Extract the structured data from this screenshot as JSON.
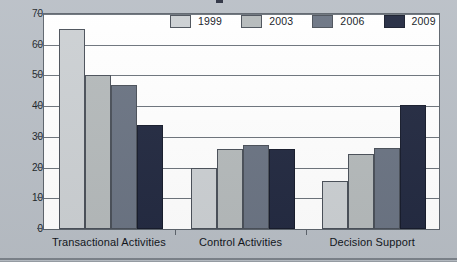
{
  "chart_data": {
    "type": "bar",
    "title": "",
    "subtitle": "",
    "xlabel": "",
    "ylabel": "Percent",
    "ylim": [
      0,
      70
    ],
    "ytick_labels": [
      "0",
      "10",
      "20",
      "30",
      "40",
      "50",
      "60",
      "70"
    ],
    "ytick_values": [
      0,
      10,
      20,
      30,
      40,
      50,
      60,
      70
    ],
    "grid": true,
    "grid_axis": "y",
    "legend_position": "top-right",
    "categories": [
      "Transactional Activities",
      "Control Activities",
      "Decision Support"
    ],
    "series": [
      {
        "name": "1999",
        "color": "#ccd0d3",
        "values": [
          65,
          20,
          15.5
        ]
      },
      {
        "name": "2003",
        "color": "#b5babb",
        "values": [
          50,
          26,
          24.5
        ]
      },
      {
        "name": "2006",
        "color": "#6b7483",
        "values": [
          47,
          27.2,
          26.3
        ]
      },
      {
        "name": "2009",
        "color": "#232a41",
        "values": [
          34,
          26,
          40.3
        ]
      }
    ]
  },
  "legend": {
    "items": [
      {
        "label": "1999"
      },
      {
        "label": "2003"
      },
      {
        "label": "2006"
      },
      {
        "label": "2009"
      }
    ]
  },
  "axes": {
    "y_title": "Percent"
  }
}
